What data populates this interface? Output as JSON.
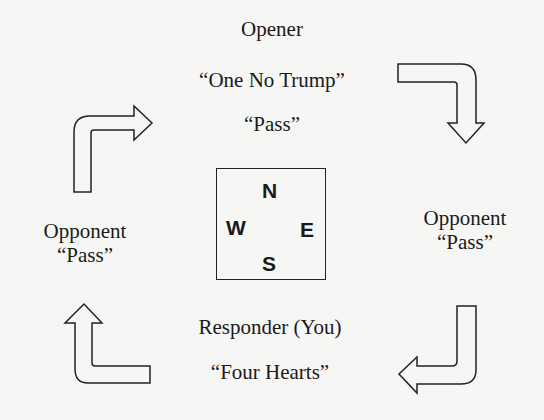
{
  "north": {
    "role": "Opener",
    "bid1": "“One No Trump”",
    "bid2": "“Pass”"
  },
  "east": {
    "role": "Opponent",
    "bid": "“Pass”"
  },
  "south": {
    "role": "Responder (You)",
    "bid": "“Four Hearts”"
  },
  "west": {
    "role": "Opponent",
    "bid": "“Pass”"
  },
  "compass": {
    "n": "N",
    "e": "E",
    "s": "S",
    "w": "W"
  },
  "colors": {
    "background": "#f6f6f4",
    "ink": "#1a1a1a"
  }
}
